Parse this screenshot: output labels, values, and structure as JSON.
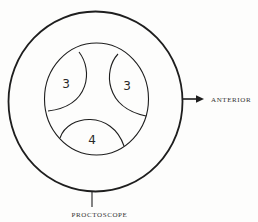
{
  "diagram": {
    "type": "anatomical-schematic",
    "colors": {
      "stroke": "#1e1e1e",
      "text": "#333333",
      "background": "#fdfdfc"
    },
    "outer_circle": {
      "label": "PROCTOSCOPE",
      "cx": 95.5,
      "cy": 101.5,
      "rx": 87,
      "ry": 90
    },
    "inner_circle": {
      "cx": 96.5,
      "cy": 99,
      "rx": 52,
      "ry": 56
    },
    "lobes": [
      {
        "position": "upper-left",
        "number": "3"
      },
      {
        "position": "upper-right",
        "number": "3"
      },
      {
        "position": "bottom",
        "number": "4"
      }
    ],
    "orientation": {
      "arrow_label": "ANTERIOR",
      "direction": "right"
    },
    "instrument_label": "PROCTOSCOPE"
  }
}
